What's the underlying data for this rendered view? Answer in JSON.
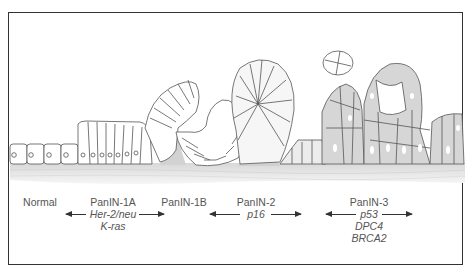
{
  "figure": {
    "stages": [
      {
        "label": "Normal",
        "genes": []
      },
      {
        "label": "PanIN-1A",
        "genes": [
          "Her-2/neu",
          "K-ras"
        ]
      },
      {
        "label": "PanIN-1B",
        "genes": []
      },
      {
        "label": "PanIN-2",
        "genes": [
          "p16"
        ]
      },
      {
        "label": "PanIN-3",
        "genes": [
          "p53",
          "DPC4",
          "BRCA2"
        ]
      }
    ],
    "arrows": [
      {
        "name": "her2-kras-span",
        "from": "PanIN-1A",
        "to": "PanIN-1B"
      },
      {
        "name": "p16-span",
        "from": "PanIN-1B",
        "to": "PanIN-2"
      },
      {
        "name": "p53-dpc4-brca2-span",
        "from": "PanIN-2",
        "to": "PanIN-3"
      }
    ],
    "colors": {
      "border": "#333333",
      "cell_outline": "#555555",
      "cell_fill_normal": "#ffffff",
      "cell_fill_dysplastic": "#d6d6d6",
      "stroma": "#e4e4e4",
      "text": "#555555"
    }
  }
}
